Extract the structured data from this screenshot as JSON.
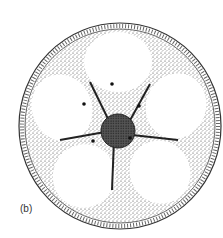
{
  "figure": {
    "label": "(b)",
    "lobes": 5,
    "seeds": 5,
    "colors": {
      "ink": "#222222",
      "paper": "#ffffff"
    }
  }
}
